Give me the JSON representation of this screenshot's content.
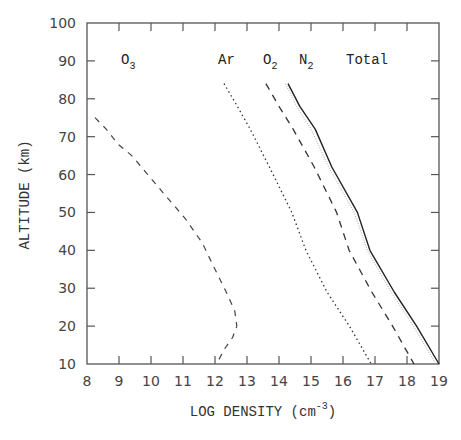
{
  "chart_data": {
    "type": "line",
    "title": "",
    "xlabel": "LOG DENSITY (cm",
    "xlabel_sup": "-3",
    "xlabel_close": ")",
    "ylabel": "ALTITUDE (km)",
    "xlim": [
      8,
      19
    ],
    "ylim": [
      10,
      100
    ],
    "xticks": [
      "8",
      "9",
      "10",
      "11",
      "12",
      "13",
      "14",
      "15",
      "16",
      "17",
      "18",
      "19"
    ],
    "yticks": [
      "10",
      "20",
      "30",
      "40",
      "50",
      "60",
      "70",
      "80",
      "90",
      "100"
    ],
    "grid": false,
    "legend_position": "inline labels near top of curves",
    "series": [
      {
        "name": "O3",
        "base": "O",
        "sub": "3",
        "style": "dashed",
        "points": [
          [
            8.25,
            75
          ],
          [
            8.6,
            72
          ],
          [
            8.97,
            68
          ],
          [
            9.4,
            65
          ],
          [
            9.9,
            60
          ],
          [
            10.5,
            54
          ],
          [
            11.06,
            48.5
          ],
          [
            11.6,
            42
          ],
          [
            12.0,
            35
          ],
          [
            12.35,
            29
          ],
          [
            12.62,
            24
          ],
          [
            12.68,
            20
          ],
          [
            12.55,
            17
          ],
          [
            12.3,
            14
          ],
          [
            12.05,
            10
          ]
        ]
      },
      {
        "name": "Ar",
        "base": "Ar",
        "sub": "",
        "style": "dotted",
        "points": [
          [
            12.28,
            84
          ],
          [
            12.7,
            78
          ],
          [
            13.1,
            72
          ],
          [
            13.7,
            62
          ],
          [
            14.4,
            50
          ],
          [
            14.84,
            40
          ],
          [
            15.5,
            29
          ],
          [
            16.2,
            20
          ],
          [
            16.88,
            10
          ]
        ]
      },
      {
        "name": "O2",
        "base": "O",
        "sub": "2",
        "style": "dashed-long",
        "points": [
          [
            13.59,
            84
          ],
          [
            14.0,
            78
          ],
          [
            14.44,
            72
          ],
          [
            15.1,
            62
          ],
          [
            15.8,
            50
          ],
          [
            16.19,
            40
          ],
          [
            16.9,
            29
          ],
          [
            17.55,
            20
          ],
          [
            18.22,
            10
          ]
        ]
      },
      {
        "name": "N2",
        "base": "N",
        "sub": "2",
        "style": "light-dotted",
        "points": [
          [
            14.2,
            84
          ],
          [
            14.55,
            78
          ],
          [
            15.0,
            72
          ],
          [
            15.55,
            62
          ],
          [
            16.35,
            50
          ],
          [
            16.76,
            40
          ],
          [
            17.5,
            29
          ],
          [
            18.2,
            20
          ],
          [
            18.9,
            10
          ]
        ]
      },
      {
        "name": "Total",
        "base": "Total",
        "sub": "",
        "style": "solid",
        "points": [
          [
            14.28,
            84
          ],
          [
            14.65,
            78
          ],
          [
            15.13,
            72
          ],
          [
            15.65,
            62
          ],
          [
            16.45,
            50
          ],
          [
            16.84,
            40
          ],
          [
            17.6,
            29
          ],
          [
            18.3,
            20
          ],
          [
            19.0,
            10
          ]
        ]
      }
    ]
  }
}
